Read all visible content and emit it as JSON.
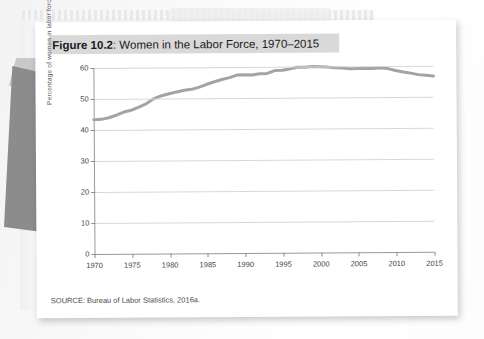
{
  "figure": {
    "label": "Figure 10.2",
    "title_prefix": "Figure 10.2",
    "title_rest": ": Women in the Labor Force, 1970–2015",
    "full_title": "Figure 10.2: Women in the Labor Force, 1970–2015",
    "source": "SOURCE: Bureau of Labor Statistics, 2016a."
  },
  "colors": {
    "series_line": "#a3a3a3",
    "gridline": "#d8d8d8",
    "axis": "#9a9a9a",
    "title_band": "#d9d9d9",
    "card": "#ffffff",
    "page_shadow": "#8c8c8c"
  },
  "chart_data": {
    "type": "line",
    "title": "Women in the Labor Force, 1970–2015",
    "xlabel": "",
    "ylabel": "Percentage of women in labor force",
    "xlim": [
      1970,
      2015
    ],
    "ylim": [
      0,
      60
    ],
    "ytick_labels": [
      "0",
      "10",
      "20",
      "30",
      "40",
      "50",
      "60"
    ],
    "yticks": [
      0,
      10,
      20,
      30,
      40,
      50,
      60
    ],
    "xtick_labels": [
      "1970",
      "1975",
      "1980",
      "1985",
      "1990",
      "1995",
      "2000",
      "2005",
      "2010",
      "2015"
    ],
    "xticks": [
      1970,
      1975,
      1980,
      1985,
      1990,
      1995,
      2000,
      2005,
      2010,
      2015
    ],
    "grid": "horizontal",
    "legend": "none",
    "series": [
      {
        "name": "Percentage of women in labor force",
        "x": [
          1970,
          1971,
          1972,
          1973,
          1974,
          1975,
          1976,
          1977,
          1978,
          1979,
          1980,
          1981,
          1982,
          1983,
          1984,
          1985,
          1986,
          1987,
          1988,
          1989,
          1990,
          1991,
          1992,
          1993,
          1994,
          1995,
          1996,
          1997,
          1998,
          1999,
          2000,
          2001,
          2002,
          2003,
          2004,
          2005,
          2006,
          2007,
          2008,
          2009,
          2010,
          2011,
          2012,
          2013,
          2014,
          2015
        ],
        "values": [
          43.3,
          43.4,
          43.9,
          44.7,
          45.7,
          46.3,
          47.3,
          48.4,
          50.0,
          50.9,
          51.5,
          52.1,
          52.6,
          52.9,
          53.6,
          54.5,
          55.3,
          56.0,
          56.6,
          57.4,
          57.5,
          57.4,
          57.8,
          57.9,
          58.8,
          58.9,
          59.3,
          59.8,
          59.8,
          60.0,
          59.9,
          59.8,
          59.6,
          59.5,
          59.2,
          59.3,
          59.4,
          59.3,
          59.5,
          59.2,
          58.6,
          58.1,
          57.7,
          57.2,
          57.0,
          56.7
        ]
      }
    ],
    "annotations": []
  }
}
